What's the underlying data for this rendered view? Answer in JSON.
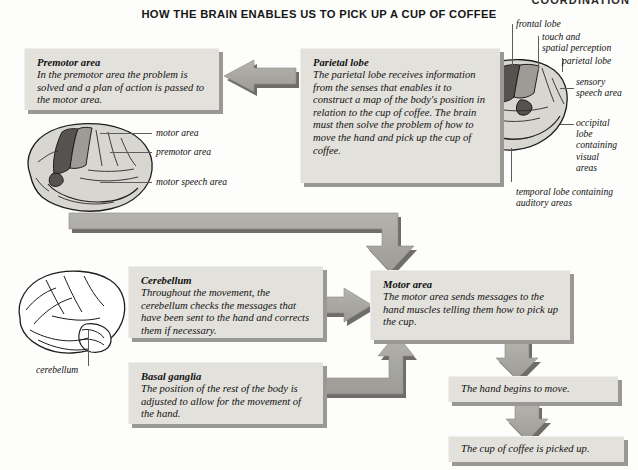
{
  "page": {
    "running_head": "COORDINATION",
    "title": "HOW THE BRAIN ENABLES US TO PICK UP A CUP OF COFFEE"
  },
  "colors": {
    "box_fill": "#e3e1dc",
    "box_shadow": "#9a9894",
    "arrow_fill": "#a8a6a1",
    "arrow_shadow": "#6f6d69",
    "brain_light": "#d8d6d0",
    "brain_mid": "#9d9b96",
    "brain_dark": "#55534f",
    "text": "#111111",
    "page_bg": "#fdfdfb"
  },
  "boxes": {
    "premotor": {
      "title": "Premotor area",
      "body": "In the premotor area the problem is solved and a plan of action is passed to the motor area."
    },
    "parietal": {
      "title": "Parietal lobe",
      "body": "The parietal lobe receives information from the senses that enables it to construct a map of the body's position in relation to the cup of coffee. The brain must then solve the problem of how to move the hand and pick up the cup of coffee."
    },
    "cerebellum": {
      "title": "Cerebellum",
      "body": "Throughout the movement, the cerebellum checks the messages that have been sent to the hand and corrects them if necessary."
    },
    "basal_ganglia": {
      "title": "Basal ganglia",
      "body": "The position of the rest of the body is adjusted to allow for the movement of the hand."
    },
    "motor_area": {
      "title": "Motor area",
      "body": "The motor area sends messages to the hand muscles telling them how to pick up the cup."
    },
    "hand_moves": {
      "title": "",
      "body": "The hand begins to move."
    },
    "cup_picked": {
      "title": "",
      "body": "The cup of coffee is picked up."
    }
  },
  "labels": {
    "left_brain": {
      "motor_area": "motor area",
      "premotor_area": "premotor area",
      "motor_speech_area": "motor speech area"
    },
    "right_brain": {
      "frontal_lobe": "frontal lobe",
      "touch_spatial": "touch and\nspatial perception",
      "parietal_lobe": "parietal lobe",
      "sensory_speech": "sensory\nspeech area",
      "occipital": "occipital\nlobe\ncontaining\nvisual\nareas",
      "temporal": "temporal lobe containing\nauditory areas"
    },
    "cerebellum_brain": {
      "cerebellum": "cerebellum"
    }
  },
  "arrows": [
    {
      "name": "parietal-to-premotor",
      "direction": "left"
    },
    {
      "name": "premotor-brain-to-motor-area",
      "direction": "down-right-elbow"
    },
    {
      "name": "cerebellum-to-motor-area",
      "direction": "right"
    },
    {
      "name": "basal-ganglia-to-motor-area",
      "direction": "up-elbow"
    },
    {
      "name": "motor-area-to-hand-moves",
      "direction": "down"
    },
    {
      "name": "hand-moves-to-cup-picked",
      "direction": "down"
    }
  ]
}
